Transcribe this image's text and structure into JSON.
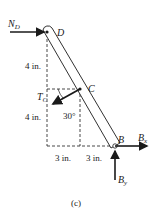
{
  "diagram": {
    "caption": "(c)",
    "points": {
      "D": "D",
      "C": "C",
      "B": "B"
    },
    "forces": {
      "N_D": {
        "main": "N",
        "sub": "D"
      },
      "T_C": {
        "main": "T",
        "sub": "C"
      },
      "B_x": {
        "main": "B",
        "sub": "x"
      },
      "B_y": {
        "main": "B",
        "sub": "y"
      }
    },
    "dimensions": {
      "upper_vertical": "4 in.",
      "lower_vertical": "4 in.",
      "left_horizontal": "3 in.",
      "right_horizontal": "3 in."
    },
    "angle": "30°",
    "colors": {
      "ink": "#1a1a1a",
      "background": "#ffffff"
    }
  }
}
